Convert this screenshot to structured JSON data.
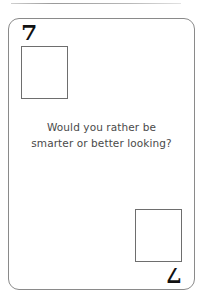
{
  "card": {
    "rank_top_left": "7",
    "rank_bottom_right": "7",
    "prompt_text": "Would you rather be smarter or better looking?",
    "suit_box_top_left": "blank-suit-box",
    "suit_box_bottom_right": "blank-suit-box",
    "colors": {
      "card_border": "#8a8a8a",
      "card_background": "#ffffff",
      "rank_color": "#111111",
      "box_border": "#6e6e6e",
      "prompt_color": "#4a4a4a",
      "sheet_edge": "#9a9a9a"
    }
  }
}
